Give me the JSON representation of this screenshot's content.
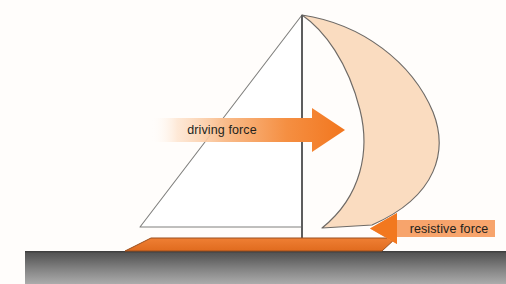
{
  "diagram": {
    "background_color": "#fffdfb",
    "labels": {
      "driving_force": "driving force",
      "resistive_force": "resistive force"
    },
    "colors": {
      "sail_fill": "#fadcc0",
      "sail_outline": "#6b6763",
      "jib_fill": "#ffffff",
      "jib_outline": "#7d7d7d",
      "mast_stroke": "#5d5d5d",
      "hull_fill": "#e9702a",
      "hull_outline": "#8a4a22",
      "arrow_orange": "#f47b27",
      "arrow_pale": "#f7a870",
      "arrow_fade": "#ffffff",
      "ground_top": "#5a5a5a",
      "ground_bottom": "#a8a8a8",
      "label_text": "#231f1c"
    },
    "forces": [
      {
        "name": "driving force",
        "direction": "right",
        "magnitude_relative": "large",
        "applied_at": "sail",
        "color": "#f47b27"
      },
      {
        "name": "resistive force",
        "direction": "left",
        "magnitude_relative": "small",
        "applied_at": "hull",
        "color": "#f7a870"
      }
    ],
    "parts": [
      {
        "name": "mast",
        "description": "vertical spar"
      },
      {
        "name": "mainsail",
        "description": "billowing crescent sail to the right of the mast"
      },
      {
        "name": "jib",
        "description": "white triangular foresail left of the mast"
      },
      {
        "name": "hull",
        "description": "orange boat body resting on the ground"
      },
      {
        "name": "ground",
        "description": "grey gradient surface band"
      }
    ]
  }
}
